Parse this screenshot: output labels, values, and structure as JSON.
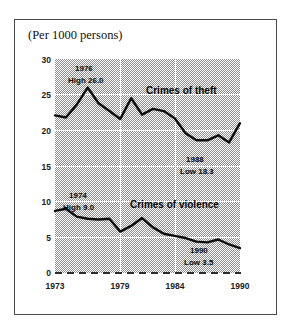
{
  "figure": {
    "title": "(Per 1000 persons)"
  },
  "chart_data": {
    "type": "line",
    "title": "(Per 1000 persons)",
    "xlabel": "",
    "ylabel": "(Per 1000 persons)",
    "xlim": [
      1973,
      1990
    ],
    "ylim": [
      0,
      30
    ],
    "yticks": [
      0,
      5,
      10,
      15,
      20,
      25,
      30
    ],
    "xticks": [
      1973,
      1979,
      1984,
      1990
    ],
    "ytick_labels": [
      "0",
      "5",
      "10",
      "15",
      "20",
      "25",
      "30"
    ],
    "xtick_labels": [
      "1973",
      "1979",
      "1984",
      "1990"
    ],
    "grid": true,
    "grid_color": "#ffffff",
    "plot_background": "#8e8e8e",
    "line_color": "#0d0d0d",
    "legend": "inline-labels",
    "x": [
      1973,
      1974,
      1975,
      1976,
      1977,
      1978,
      1979,
      1980,
      1981,
      1982,
      1983,
      1984,
      1985,
      1986,
      1987,
      1988,
      1989,
      1990
    ],
    "series": [
      {
        "name": "Crimes of theft",
        "values": [
          22.1,
          21.8,
          23.6,
          26.0,
          23.8,
          22.7,
          21.6,
          24.5,
          22.2,
          23.0,
          22.7,
          21.7,
          19.6,
          18.6,
          18.6,
          19.3,
          18.3,
          21.0
        ]
      },
      {
        "name": "Crimes of violence",
        "values": [
          8.7,
          9.0,
          7.9,
          7.6,
          7.5,
          7.6,
          5.8,
          6.6,
          7.7,
          6.4,
          5.5,
          5.2,
          4.9,
          4.4,
          4.3,
          4.7,
          4.0,
          3.5
        ]
      }
    ],
    "annotations": [
      {
        "id": "theft-high",
        "lines": [
          "1976",
          "High 26.0"
        ],
        "x": 1976,
        "y": 26.0
      },
      {
        "id": "theft-low",
        "lines": [
          "1988",
          "Low 18.3"
        ],
        "x": 1988,
        "y": 18.3
      },
      {
        "id": "violence-high",
        "lines": [
          "1974",
          "High 9.0"
        ],
        "x": 1974,
        "y": 9.0
      },
      {
        "id": "violence-low",
        "lines": [
          "1990",
          "Low 3.5"
        ],
        "x": 1990,
        "y": 3.5
      }
    ]
  },
  "labels": {
    "theft_series": "Crimes of theft",
    "violence_series": "Crimes of violence",
    "theft_high_year": "1976",
    "theft_high_value": "High 26.0",
    "theft_low_year": "1988",
    "theft_low_value": "Low 18.3",
    "violence_high_year": "1974",
    "violence_high_value": "High 9.0",
    "violence_low_year": "1990",
    "violence_low_value": "Low 3.5"
  }
}
